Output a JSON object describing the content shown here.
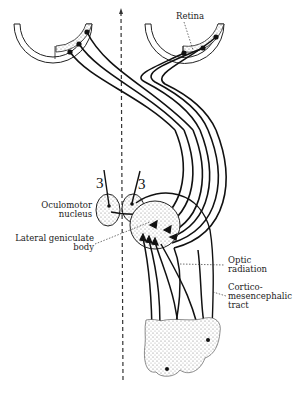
{
  "figure": {
    "colors": {
      "ink": "#111111",
      "stipple": "#bdbdbd",
      "background": "#ffffff"
    }
  },
  "labels": {
    "retina": "Retina",
    "oculomotor_line1": "Oculomotor",
    "oculomotor_line2": "nucleus",
    "lgb_line1": "Lateral geniculate",
    "lgb_line2": "body",
    "optic_rad_line1": "Optic",
    "optic_rad_line2": "radiation",
    "cortico_line1": "Cortico-",
    "cortico_line2": "mesencephalic",
    "cortico_line3": "tract",
    "nerve_left": "3",
    "nerve_right": "3"
  }
}
